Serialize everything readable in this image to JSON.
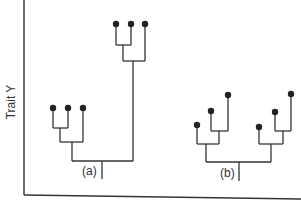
{
  "axes": {
    "y_label": "Trait Y",
    "x_label": ""
  },
  "trees": [
    {
      "label": "(a)",
      "description": "Phylogeny with one clade of three tips low on trait Y and one clade of three tips high on trait Y"
    },
    {
      "label": "(b)",
      "description": "Phylogeny with two clades each of three tips at staggered intermediate trait Y values"
    }
  ],
  "colors": {
    "line": "#333333",
    "tip": "#222222",
    "background": "#ffffff"
  }
}
